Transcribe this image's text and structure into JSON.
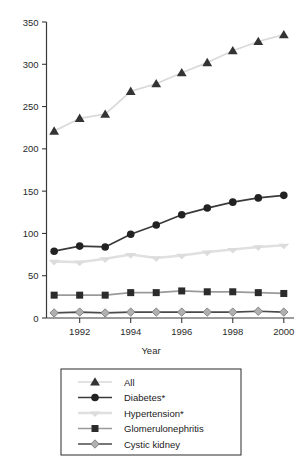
{
  "chart_data": {
    "type": "line",
    "title": "",
    "xlabel": "Year",
    "ylabel": "",
    "x": [
      1991,
      1992,
      1993,
      1994,
      1995,
      1996,
      1997,
      1998,
      1999,
      2000
    ],
    "xlim": [
      1990.7,
      2000.4
    ],
    "ylim": [
      0,
      350
    ],
    "xticks": [
      1992,
      1994,
      1996,
      1998,
      2000
    ],
    "xtick_labels": [
      "1992",
      "1994",
      "1996",
      "1998",
      "2000"
    ],
    "yticks": [
      0,
      50,
      100,
      150,
      200,
      250,
      300,
      350
    ],
    "ytick_labels": [
      "0",
      "50",
      "100",
      "150",
      "200",
      "250",
      "300",
      "350"
    ],
    "grid": false,
    "legend_position": "bottom",
    "series": [
      {
        "name": "All",
        "marker": "triangle",
        "color": "#d9d9d9",
        "marker_color": "#333333",
        "values": [
          221,
          236,
          241,
          268,
          277,
          290,
          302,
          316,
          327,
          335
        ]
      },
      {
        "name": "Diabetes*",
        "marker": "circle",
        "color": "#3a3a3a",
        "marker_color": "#222222",
        "values": [
          79,
          85,
          84,
          99,
          110,
          122,
          130,
          137,
          142,
          145
        ]
      },
      {
        "name": "Hypertension*",
        "marker": "cross",
        "color": "#e0e0e0",
        "marker_color": "#dcdcdc",
        "values": [
          67,
          66,
          70,
          75,
          71,
          74,
          78,
          81,
          84,
          86
        ]
      },
      {
        "name": "Glomerulonephritis",
        "marker": "square",
        "color": "#9a9a9a",
        "marker_color": "#2b2b2b",
        "values": [
          27,
          27,
          27,
          30,
          30,
          32,
          31,
          31,
          30,
          29
        ]
      },
      {
        "name": "Cystic kidney",
        "marker": "diamond",
        "color": "#4a4a4a",
        "marker_color": "#b0b0b0",
        "values": [
          6,
          7,
          6,
          7,
          7,
          7,
          7,
          7,
          8,
          7
        ]
      }
    ]
  },
  "axis": {
    "x_title": "Year"
  },
  "legend": {
    "items": [
      {
        "label": "All"
      },
      {
        "label": "Diabetes*"
      },
      {
        "label": "Hypertension*"
      },
      {
        "label": "Glomerulonephritis"
      },
      {
        "label": "Cystic kidney"
      }
    ]
  }
}
